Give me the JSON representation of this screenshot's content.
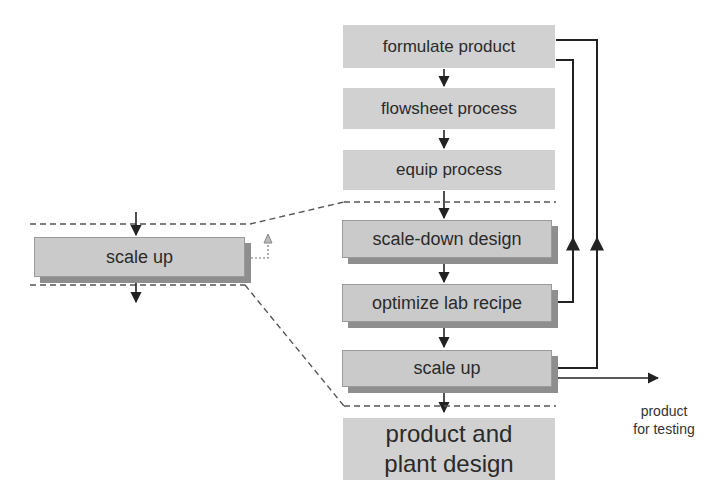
{
  "diagram": {
    "main_flow": [
      {
        "id": "formulate",
        "label": "formulate product",
        "style": "flat"
      },
      {
        "id": "flowsheet",
        "label": "flowsheet process",
        "style": "flat"
      },
      {
        "id": "equip",
        "label": "equip process",
        "style": "flat"
      },
      {
        "id": "scaledown",
        "label": "scale-down design",
        "style": "raised"
      },
      {
        "id": "optimize",
        "label": "optimize lab recipe",
        "style": "raised"
      },
      {
        "id": "scaleup",
        "label": "scale up",
        "style": "raised"
      },
      {
        "id": "plant",
        "label_line1": "product and",
        "label_line2": "plant design",
        "style": "flat"
      }
    ],
    "inset": {
      "label": "scale up",
      "description": "zoomed view of scale up step"
    },
    "output": {
      "line1": "product",
      "line2": "for testing"
    },
    "feedback_loops": [
      {
        "from": "optimize lab recipe",
        "to": "formulate product"
      },
      {
        "from": "scale up",
        "to": "formulate product"
      }
    ],
    "colors": {
      "box_fill": "#dcdcdc",
      "raised_fill": "#cfcfcf",
      "shadow": "#8e8e8e",
      "line": "#222222",
      "dash": "#555555"
    }
  }
}
